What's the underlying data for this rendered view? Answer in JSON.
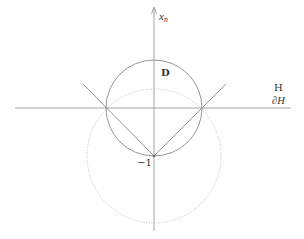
{
  "diagram": {
    "labels": {
      "axis_x": "x",
      "axis_x_sub": "n",
      "disk": "D",
      "half_space": "H",
      "boundary": "∂H",
      "point": "−1"
    },
    "colors": {
      "stroke": "#8a8a8a",
      "axis": "#9a9a9a",
      "dotted": "#b8b8b8",
      "text": "#333333"
    },
    "geometry": {
      "origin": [
        154,
        108
      ],
      "unit_circle_radius": 48,
      "dotted_circle_center": [
        154,
        156
      ],
      "dotted_circle_radius": 67,
      "point_minus_one": [
        154,
        156
      ]
    }
  }
}
